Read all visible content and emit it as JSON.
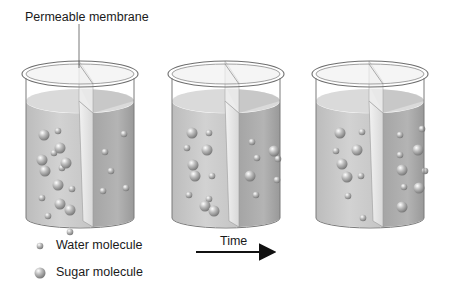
{
  "diagram": {
    "title_label": "Permeable membrane",
    "time_label": "Time",
    "legend": {
      "water": {
        "label": "Water molecule",
        "icon": "small-sphere-icon"
      },
      "sugar": {
        "label": "Sugar molecule",
        "icon": "large-sphere-icon"
      }
    },
    "colors": {
      "left_solution": "#c9c9c9",
      "right_solution": "#a9a9a9",
      "glass_outline": "#7a7a7a",
      "membrane": "#e4e4e4",
      "arrow": "#111111"
    },
    "beakers": [
      {
        "name": "beaker-initial",
        "x": 22,
        "left": {
          "water": [
            [
              58,
              131
            ],
            [
              54,
              153
            ],
            [
              62,
              168
            ],
            [
              70,
              232
            ],
            [
              42,
              198
            ],
            [
              72,
              189
            ],
            [
              48,
              216
            ]
          ],
          "sugar": [
            [
              44,
              135
            ],
            [
              60,
              148
            ],
            [
              42,
              160
            ],
            [
              66,
              163
            ],
            [
              45,
              171
            ],
            [
              58,
              185
            ],
            [
              60,
              204
            ],
            [
              70,
              210
            ]
          ]
        },
        "right": {
          "water": [
            [
              124,
              134
            ],
            [
              105,
              152
            ],
            [
              111,
              171
            ],
            [
              103,
              191
            ],
            [
              126,
              188
            ]
          ],
          "sugar": []
        }
      },
      {
        "name": "beaker-middle",
        "x": 168,
        "left": {
          "water": [
            [
              209,
              133
            ],
            [
              187,
              148
            ],
            [
              212,
              176
            ],
            [
              189,
              195
            ],
            [
              209,
              199
            ]
          ],
          "sugar": [
            [
              192,
              133
            ],
            [
              207,
              150
            ],
            [
              193,
              165
            ],
            [
              195,
              176
            ],
            [
              205,
              206
            ],
            [
              214,
              211
            ]
          ]
        },
        "right": {
          "water": [
            [
              252,
              142
            ],
            [
              257,
              158
            ],
            [
              278,
              159
            ],
            [
              277,
              180
            ],
            [
              256,
              195
            ]
          ],
          "sugar": [
            [
              274,
              151
            ],
            [
              250,
              176
            ]
          ]
        }
      },
      {
        "name": "beaker-final",
        "x": 312,
        "left": {
          "water": [
            [
              362,
              132
            ],
            [
              336,
              151
            ],
            [
              361,
              176
            ],
            [
              348,
              196
            ],
            [
              363,
              218
            ]
          ],
          "sugar": [
            [
              340,
              133
            ],
            [
              357,
              150
            ],
            [
              342,
              164
            ],
            [
              347,
              177
            ]
          ]
        },
        "right": {
          "water": [
            [
              400,
              135
            ],
            [
              422,
              129
            ],
            [
              400,
              155
            ],
            [
              425,
              171
            ],
            [
              404,
              187
            ]
          ],
          "sugar": [
            [
              418,
              150
            ],
            [
              402,
              170
            ],
            [
              419,
              188
            ],
            [
              402,
              207
            ]
          ]
        }
      }
    ]
  }
}
